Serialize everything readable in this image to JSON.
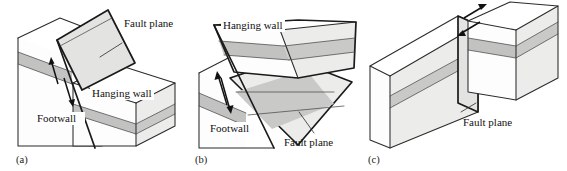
{
  "figure": {
    "background_color": "#ffffff",
    "line_color": "#2b2b2b",
    "strata_color": "#c6c6c5",
    "block_side_color": "#ececeb"
  },
  "panels": [
    {
      "id": "a",
      "caption": "(a)",
      "fault_type": "normal-fault",
      "labels": {
        "fault_plane": "Fault plane",
        "hanging_wall": "Hanging wall",
        "footwall": "Footwall"
      },
      "slip_arrows": {
        "count": 2,
        "sense": "down-dip",
        "description": "hanging wall moves down relative to footwall"
      }
    },
    {
      "id": "b",
      "caption": "(b)",
      "fault_type": "reverse-fault",
      "labels": {
        "fault_plane": "Fault plane",
        "hanging_wall": "Hanging wall",
        "footwall": "Footwall"
      },
      "slip_arrows": {
        "count": 2,
        "sense": "up-dip",
        "description": "hanging wall moves up relative to footwall"
      }
    },
    {
      "id": "c",
      "caption": "(c)",
      "fault_type": "strike-slip-fault",
      "labels": {
        "fault_plane": "Fault plane"
      },
      "slip_arrows": {
        "count": 2,
        "sense": "lateral",
        "description": "blocks slide horizontally past each other"
      }
    }
  ]
}
